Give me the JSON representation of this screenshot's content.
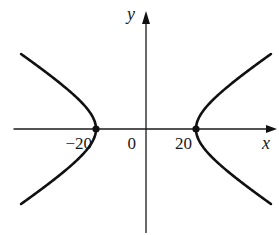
{
  "chart_data": {
    "type": "line",
    "title": "",
    "equation": {
      "form": "x^2/a^2 - y^2/b^2 = 1",
      "a": 20,
      "b": 13.1
    },
    "xlabel": "x",
    "ylabel": "y",
    "xlim": [
      -53,
      53
    ],
    "ylim": [
      -42,
      47
    ],
    "grid": false,
    "legend": "none",
    "x_ticks": [
      {
        "value": -20,
        "label": "−20"
      },
      {
        "value": 0,
        "label": "0"
      },
      {
        "value": 20,
        "label": "20"
      }
    ],
    "series": [
      {
        "name": "left-branch",
        "branch": -1,
        "y_range": [
          -30,
          30
        ]
      },
      {
        "name": "right-branch",
        "branch": 1,
        "y_range": [
          -30,
          30
        ]
      }
    ],
    "points": [
      {
        "name": "left-vertex",
        "x": -20,
        "y": 0
      },
      {
        "name": "right-vertex",
        "x": 20,
        "y": 0
      }
    ],
    "colors": {
      "ink": "#111111",
      "background": "#ffffff"
    }
  }
}
